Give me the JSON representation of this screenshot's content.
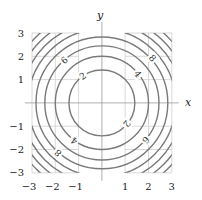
{
  "chart_data": {
    "type": "contour",
    "function": "x^2 + y^2",
    "title": "",
    "xlabel": "x",
    "ylabel": "y",
    "xlim": [
      -3,
      3
    ],
    "ylim": [
      -3,
      3
    ],
    "x_ticks": [
      -3,
      -2,
      -1,
      1,
      2,
      3
    ],
    "y_ticks": [
      3,
      2,
      1,
      -1,
      -2,
      -3
    ],
    "x_tick_labels": [
      "−3",
      "−2",
      "−1",
      "1",
      "2",
      "3"
    ],
    "y_tick_labels": [
      "3",
      "2",
      "1",
      "−1",
      "−2",
      "−3"
    ],
    "grid": true,
    "levels": [
      2,
      4,
      6,
      8,
      10,
      12,
      14,
      16
    ],
    "contour_labels": [
      {
        "text": "6",
        "x": -1.62,
        "y": 1.84
      },
      {
        "text": "2",
        "x": -0.82,
        "y": 1.16
      },
      {
        "text": "8",
        "x": 2.18,
        "y": 1.93
      },
      {
        "text": "4",
        "x": 1.54,
        "y": 1.24
      },
      {
        "text": "2",
        "x": 1.07,
        "y": -0.9
      },
      {
        "text": "6",
        "x": 1.89,
        "y": -1.59
      },
      {
        "text": "4",
        "x": -1.2,
        "y": -1.63
      },
      {
        "text": "8",
        "x": -1.89,
        "y": -2.15
      }
    ],
    "colors": {
      "contour": "#7a7a7a",
      "grid": "#cfcfcf",
      "axis": "#999999"
    }
  }
}
